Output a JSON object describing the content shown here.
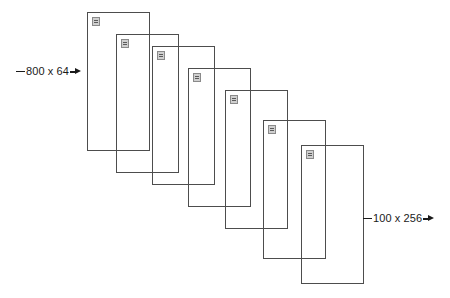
{
  "diagram": {
    "background_color": "#ffffff",
    "stroke_color": "#4d4d4d",
    "text_color": "#1a1a1a",
    "icon_color": "#cfcfcf",
    "layers": [
      {
        "name": "layer-1",
        "x": 87,
        "y": 12,
        "width": 63,
        "height": 139,
        "icon": "window-glyph-icon"
      },
      {
        "name": "layer-2",
        "x": 116,
        "y": 34,
        "width": 63,
        "height": 139,
        "icon": "window-glyph-icon"
      },
      {
        "name": "layer-3",
        "x": 152,
        "y": 46,
        "width": 63,
        "height": 139,
        "icon": "window-glyph-icon"
      },
      {
        "name": "layer-4",
        "x": 188,
        "y": 68,
        "width": 63,
        "height": 139,
        "icon": "window-glyph-icon"
      },
      {
        "name": "layer-5",
        "x": 225,
        "y": 90,
        "width": 63,
        "height": 139,
        "icon": "window-glyph-icon"
      },
      {
        "name": "layer-6",
        "x": 263,
        "y": 120,
        "width": 63,
        "height": 139,
        "icon": "window-glyph-icon"
      },
      {
        "name": "layer-7",
        "x": 301,
        "y": 145,
        "width": 63,
        "height": 139,
        "icon": "window-glyph-icon"
      }
    ],
    "annotations": {
      "left": {
        "label": "800 x 64",
        "dimensions": [
          800,
          64
        ],
        "arrow": "right"
      },
      "right": {
        "label": "100 x 256",
        "dimensions": [
          100,
          256
        ],
        "arrow": "right"
      }
    }
  }
}
